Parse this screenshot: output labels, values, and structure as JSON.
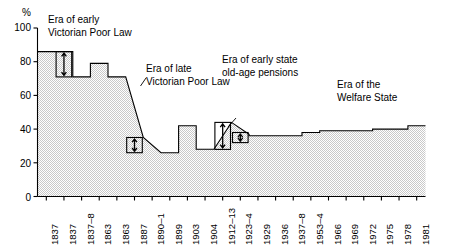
{
  "chart_data": {
    "type": "area",
    "title": "",
    "subtitle": "",
    "xlabel": "",
    "ylabel": "%",
    "ylim": [
      0,
      100
    ],
    "yticks": [
      0,
      20,
      40,
      60,
      80,
      100
    ],
    "grid": false,
    "legend_position": "none",
    "step_style": "post",
    "categories": [
      "1837",
      "1837",
      "1837–8",
      "1863",
      "1863",
      "1887",
      "1890–1",
      "1899",
      "1903",
      "1904",
      "1912–13",
      "1923–4",
      "1929",
      "1936",
      "1937–8",
      "1953–4",
      "1966",
      "1969",
      "1972",
      "1975",
      "1978",
      "1981"
    ],
    "values": [
      86,
      86,
      71,
      79,
      71,
      35,
      26,
      26,
      42,
      28,
      44,
      37,
      36,
      36,
      36,
      38,
      39,
      39,
      39,
      40,
      40,
      42
    ],
    "annotations": [
      {
        "id": "era-early-victorian-poor-law",
        "text_line1": "Era of early",
        "text_line2": "Victorian Poor Law"
      },
      {
        "id": "era-late-victorian-poor-law",
        "text_line1": "Era of late",
        "text_line2": "Victorian Poor Law"
      },
      {
        "id": "era-early-state-old-age-pensions",
        "text_line1": "Era of early state",
        "text_line2": "old-age pensions"
      },
      {
        "id": "era-welfare-state",
        "text_line1": "Era of the",
        "text_line2": "Welfare State"
      }
    ],
    "measure_boxes": [
      {
        "id": "measure-box-1",
        "from": 71,
        "to": 86
      },
      {
        "id": "measure-box-2",
        "from": 26,
        "to": 35
      },
      {
        "id": "measure-box-3",
        "from": 28,
        "to": 44
      },
      {
        "id": "measure-box-4",
        "from": 32,
        "to": 38
      }
    ],
    "colors": {
      "fill": "#dcdcdc",
      "line": "#000000",
      "axis": "#000000",
      "text": "#000000",
      "background": "#ffffff"
    }
  },
  "axis": {
    "y_unit_label": "%",
    "y_tick_labels": [
      "100",
      "80",
      "60",
      "40",
      "20",
      "0"
    ],
    "x_tick_labels": [
      "1837",
      "1837",
      "1837–8",
      "1863",
      "1863",
      "1887",
      "1890–1",
      "1899",
      "1903",
      "1904",
      "1912–13",
      "1923–4",
      "1929",
      "1936",
      "1937–8",
      "1953–4",
      "1966",
      "1969",
      "1972",
      "1975",
      "1978",
      "1981"
    ]
  },
  "annotations": {
    "early_poor_law": {
      "line1": "Era of early",
      "line2": "Victorian Poor Law"
    },
    "late_poor_law": {
      "line1": "Era of late",
      "line2": "Victorian Poor Law"
    },
    "old_age_pensions": {
      "line1": "Era of early state",
      "line2": "old-age pensions"
    },
    "welfare_state": {
      "line1": "Era of the",
      "line2": "Welfare State"
    }
  }
}
